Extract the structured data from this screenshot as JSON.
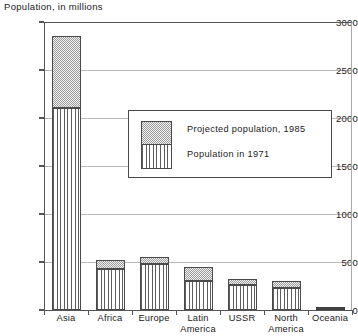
{
  "chart_data": {
    "type": "bar",
    "title": "Population, in millions",
    "xlabel": "",
    "ylabel": "Population, in millions",
    "ylim": [
      0,
      3000
    ],
    "yticks": [
      0,
      500,
      1000,
      1500,
      2000,
      2500,
      3000
    ],
    "ytick_labels": [
      "0",
      "500",
      "1000",
      "1500",
      "2000",
      "2500",
      "3000"
    ],
    "grid": true,
    "stacked": true,
    "legend_position": "inside-upper-right",
    "categories": [
      "Asia",
      "Africa",
      "Europe",
      "Latin\nAmerica",
      "USSR",
      "North\nAmerica",
      "Oceania"
    ],
    "series": [
      {
        "name": "Population in 1971",
        "fill": "vertical-lines",
        "values": [
          2100,
          430,
          480,
          305,
          265,
          230,
          20
        ]
      },
      {
        "name": "Projected population, 1985",
        "fill": "stipple",
        "values": [
          2850,
          525,
          555,
          450,
          325,
          305,
          28
        ]
      }
    ]
  },
  "legend": {
    "items": [
      {
        "label": "Projected population, 1985",
        "swatch": "stipple-swatch"
      },
      {
        "label": "Population  in 1971",
        "swatch": "vertical-lines-swatch"
      }
    ]
  },
  "colors": {
    "axis": "#4a4a4a",
    "gridline": "#b9b9b9",
    "stipple_light": "#f2f2f2",
    "stipple_dark": "#9c9c9c",
    "hatch": "#5e5e5e",
    "background": "#ffffff"
  }
}
